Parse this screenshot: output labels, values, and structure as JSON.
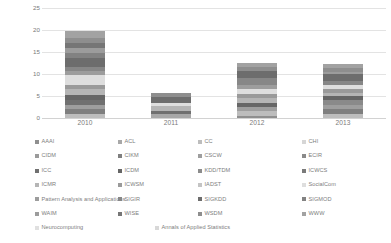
{
  "chart_data": {
    "type": "bar",
    "subtype": "stacked-bar",
    "title": "",
    "xlabel": "",
    "ylabel": "",
    "categories": [
      "2010",
      "2011",
      "2012",
      "2013"
    ],
    "ylim": [
      0,
      25
    ],
    "yticks": [
      0,
      5,
      10,
      15,
      20,
      25
    ],
    "grid": true,
    "legend_position": "bottom",
    "totals": [
      19.8,
      5.7,
      12.6,
      11.4
    ],
    "series": [
      {
        "name": "AAAI",
        "color": "#8f8f8f",
        "values": [
          0.0,
          0.0,
          0.4,
          0.0
        ]
      },
      {
        "name": "ACL",
        "color": "#a8a8a8",
        "values": [
          0.0,
          1.0,
          0.0,
          0.0
        ]
      },
      {
        "name": "CC",
        "color": "#bdbdbd",
        "values": [
          1.0,
          0.0,
          1.1,
          1.0
        ]
      },
      {
        "name": "CHI",
        "color": "#d6d6d6",
        "values": [
          0.0,
          0.0,
          0.0,
          0.0
        ]
      },
      {
        "name": "CIDM",
        "color": "#9b9b9b",
        "values": [
          0.0,
          0.0,
          0.0,
          0.0
        ]
      },
      {
        "name": "CIKM",
        "color": "#7f7f7f",
        "values": [
          1.0,
          0.0,
          0.0,
          1.0
        ]
      },
      {
        "name": "CSCW",
        "color": "#9e9e9e",
        "values": [
          1.0,
          0.0,
          1.0,
          1.0
        ]
      },
      {
        "name": "ECIR",
        "color": "#8a8a8a",
        "values": [
          0.0,
          0.0,
          0.0,
          1.0
        ]
      },
      {
        "name": "ICC",
        "color": "#707070",
        "values": [
          1.0,
          0.6,
          0.0,
          0.0
        ]
      },
      {
        "name": "ICDM",
        "color": "#666666",
        "values": [
          1.2,
          0.0,
          1.0,
          1.0
        ]
      },
      {
        "name": "KDD/TDM",
        "color": "#8c8c8c",
        "values": [
          0.0,
          0.0,
          0.0,
          0.0
        ]
      },
      {
        "name": "ICWCS",
        "color": "#7a7a7a",
        "values": [
          0.0,
          0.0,
          0.0,
          0.0
        ]
      },
      {
        "name": "ICMR",
        "color": "#b5b5b5",
        "values": [
          1.3,
          1.1,
          1.0,
          0.6
        ]
      },
      {
        "name": "ICWSM",
        "color": "#9a9a9a",
        "values": [
          1.0,
          0.0,
          1.0,
          1.0
        ]
      },
      {
        "name": "IADST",
        "color": "#c4c4c4",
        "values": [
          0.0,
          0.0,
          0.0,
          0.0
        ]
      },
      {
        "name": "SocialCom",
        "color": "#dedede",
        "values": [
          2.2,
          0.8,
          1.1,
          0.9
        ]
      },
      {
        "name": "Pattern Analysis and Applications",
        "color": "#9d9d9d",
        "values": [
          1.0,
          0.0,
          1.0,
          0.0
        ]
      },
      {
        "name": "SIGIR",
        "color": "#878787",
        "values": [
          1.0,
          0.0,
          1.5,
          1.0
        ]
      },
      {
        "name": "SIGKDD",
        "color": "#6d6d6d",
        "values": [
          2.0,
          1.2,
          1.5,
          1.5
        ]
      },
      {
        "name": "SIGMOD",
        "color": "#828282",
        "values": [
          1.0,
          0.0,
          0.0,
          0.0
        ]
      },
      {
        "name": "WAIM",
        "color": "#9c9c9c",
        "values": [
          1.3,
          0.0,
          0.0,
          0.5
        ]
      },
      {
        "name": "WISE",
        "color": "#767676",
        "values": [
          1.0,
          0.0,
          0.0,
          0.0
        ]
      },
      {
        "name": "WSDM",
        "color": "#8e8e8e",
        "values": [
          1.3,
          1.0,
          1.0,
          1.0
        ]
      },
      {
        "name": "WWW",
        "color": "#a2a2a2",
        "values": [
          1.5,
          0.0,
          1.0,
          0.9
        ]
      },
      {
        "name": "Neurocomputing",
        "color": "#e0e0e0",
        "values": [
          0.0,
          0.0,
          0.0,
          0.0
        ]
      },
      {
        "name": "Annals of Applied Statistics",
        "color": "#d8d8d8",
        "values": [
          0.0,
          0.0,
          0.0,
          0.0
        ]
      }
    ]
  },
  "legend": {
    "rows": [
      [
        {
          "label": "AAAI",
          "color": "#8f8f8f"
        },
        {
          "label": "ACL",
          "color": "#a8a8a8"
        },
        {
          "label": "CC",
          "color": "#bdbdbd"
        },
        {
          "label": "CHI",
          "color": "#d6d6d6"
        }
      ],
      [
        {
          "label": "CIDM",
          "color": "#9b9b9b"
        },
        {
          "label": "CIKM",
          "color": "#7f7f7f"
        },
        {
          "label": "CSCW",
          "color": "#9e9e9e"
        },
        {
          "label": "ECIR",
          "color": "#8a8a8a"
        }
      ],
      [
        {
          "label": "ICC",
          "color": "#707070"
        },
        {
          "label": "ICDM",
          "color": "#666666"
        },
        {
          "label": "KDD/TDM",
          "color": "#8c8c8c"
        },
        {
          "label": "ICWCS",
          "color": "#7a7a7a"
        }
      ],
      [
        {
          "label": "ICMR",
          "color": "#b5b5b5"
        },
        {
          "label": "ICWSM",
          "color": "#9a9a9a"
        },
        {
          "label": "IADST",
          "color": "#c4c4c4"
        },
        {
          "label": "SocialCom",
          "color": "#dedede"
        }
      ],
      [
        {
          "label": "Pattern Analysis and Applications",
          "color": "#9d9d9d"
        },
        {
          "label": "SIGIR",
          "color": "#878787"
        },
        {
          "label": "SIGKDD",
          "color": "#6d6d6d"
        },
        {
          "label": "SIGMOD",
          "color": "#828282"
        }
      ],
      [
        {
          "label": "WAIM",
          "color": "#9c9c9c"
        },
        {
          "label": "WISE",
          "color": "#767676"
        },
        {
          "label": "WSDM",
          "color": "#8e8e8e"
        },
        {
          "label": "WWW",
          "color": "#a2a2a2"
        }
      ],
      [
        {
          "label": "Neurocomputing",
          "color": "#e0e0e0"
        },
        {
          "label": "Annals of Applied Statistics",
          "color": "#d8d8d8"
        }
      ]
    ]
  }
}
